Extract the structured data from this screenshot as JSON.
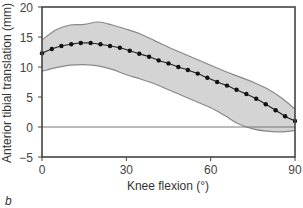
{
  "panel_label": "b",
  "chart_data": {
    "type": "line",
    "title": "",
    "xlabel": "Knee flexion (°)",
    "ylabel": "Anterior tibial translation (mm)",
    "xlim": [
      0,
      90
    ],
    "ylim": [
      -5,
      20
    ],
    "xticks": [
      0,
      30,
      60,
      90
    ],
    "yticks": [
      -5,
      0,
      5,
      10,
      15,
      20
    ],
    "grid": false,
    "legend": null,
    "reference_line_y": 0,
    "series": [
      {
        "name": "Mean",
        "style": "line-with-markers",
        "color": "#222222",
        "x": [
          0,
          3.5,
          6.9,
          10.4,
          13.8,
          17.3,
          20.8,
          24.2,
          27.7,
          31.2,
          34.6,
          38.1,
          41.5,
          45.0,
          48.5,
          51.9,
          55.4,
          58.8,
          62.3,
          65.8,
          69.2,
          72.7,
          76.2,
          79.6,
          83.1,
          86.5,
          90.0
        ],
        "y": [
          12.3,
          13.0,
          13.5,
          13.8,
          14.0,
          14.0,
          13.8,
          13.5,
          13.2,
          12.7,
          12.2,
          11.7,
          11.1,
          10.6,
          10.0,
          9.5,
          8.9,
          8.2,
          7.5,
          6.9,
          6.2,
          5.5,
          4.7,
          3.8,
          2.8,
          1.8,
          1.0
        ]
      },
      {
        "name": "Upper bound",
        "style": "band-upper",
        "color": "#888888",
        "x": [
          0,
          5,
          10,
          15,
          20,
          25,
          30,
          35,
          40,
          45,
          50,
          55,
          60,
          65,
          70,
          75,
          80,
          85,
          90
        ],
        "y": [
          14.5,
          16.2,
          17.0,
          17.1,
          17.5,
          17.0,
          16.3,
          15.5,
          14.4,
          13.3,
          12.3,
          11.3,
          10.3,
          9.3,
          8.4,
          7.5,
          6.4,
          4.9,
          3.0
        ]
      },
      {
        "name": "Lower bound",
        "style": "band-lower",
        "color": "#888888",
        "x": [
          0,
          5,
          10,
          15,
          20,
          25,
          30,
          35,
          40,
          45,
          50,
          55,
          60,
          65,
          70,
          75,
          80,
          85,
          90
        ],
        "y": [
          9.3,
          9.9,
          10.3,
          10.4,
          10.2,
          9.6,
          8.7,
          8.0,
          7.2,
          6.2,
          5.2,
          4.2,
          3.2,
          1.9,
          0.5,
          -0.3,
          -0.7,
          -0.8,
          -0.6
        ]
      }
    ],
    "band_fill": "#d4d4d4",
    "axis_color": "#444444"
  }
}
